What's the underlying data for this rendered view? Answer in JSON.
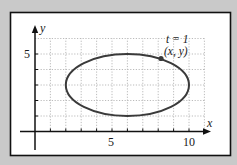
{
  "figure": {
    "background_color": "#c9c9c9",
    "panel_color": "#ffffff",
    "curve_color": "#3a3a3a",
    "grid_color": "#aaaaaa"
  },
  "chart_data": {
    "type": "line",
    "title": "",
    "xlabel": "x",
    "ylabel": "y",
    "xlim": [
      0,
      11
    ],
    "ylim": [
      0,
      6
    ],
    "grid": true,
    "x_ticks": [
      1,
      2,
      3,
      4,
      5,
      6,
      7,
      8,
      9,
      10
    ],
    "y_ticks": [
      1,
      2,
      3,
      4,
      5
    ],
    "x_tick_labels": [
      {
        "value": 5,
        "label": "5"
      },
      {
        "value": 10,
        "label": "10"
      }
    ],
    "y_tick_labels": [
      {
        "value": 5,
        "label": "5"
      }
    ],
    "series": [
      {
        "name": "ellipse",
        "shape": "ellipse",
        "center": [
          6,
          3
        ],
        "semi_axis_x": 4,
        "semi_axis_y": 2
      }
    ],
    "annotations": [
      {
        "type": "point",
        "x": 8.2,
        "y": 4.7,
        "label_line1": "t = 1",
        "label_line2": "(x, y)"
      }
    ]
  },
  "labels": {
    "x_axis": "x",
    "y_axis": "y",
    "x_tick_5": "5",
    "x_tick_10": "10",
    "y_tick_5": "5",
    "annotation_t": "t = 1",
    "annotation_xy": "(x, y)"
  }
}
